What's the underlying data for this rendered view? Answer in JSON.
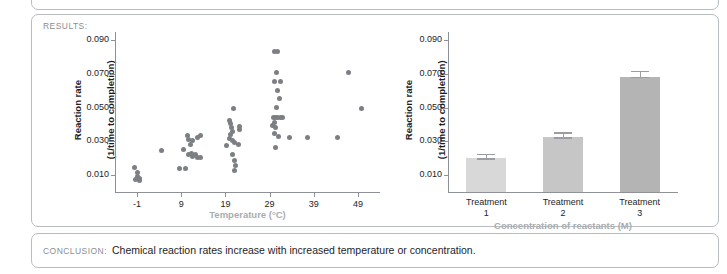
{
  "document": {
    "results_label": "RESULTS:",
    "conclusion_label": "CONCLUSION:",
    "conclusion_text": "Chemical reaction rates increase with increased temperature or concentration."
  },
  "colors": {
    "panel_border": "#b9bcc0",
    "section_label": "#8b8e92",
    "body_text": "#1d1d1f",
    "axis": "#8e9195",
    "dot": "#7c7f83",
    "axis_title_x_muted": "#a9acb0",
    "bar_1": "#d8d8d8",
    "bar_2": "#c6c6c6",
    "bar_3": "#b4b4b4",
    "error_bar": "#9a9da1"
  },
  "chart_data": [
    {
      "id": "scatter-temperature",
      "type": "scatter",
      "title": "",
      "xlabel": "Temperature (°C)",
      "ylabel": "Reaction rate\n(1/time to completion)",
      "ylabel_line1": "Reaction rate",
      "ylabel_line2": "(1/time to completion)",
      "xlabel_color": "#a9acb0",
      "xlim": [
        -6,
        54
      ],
      "ylim": [
        0.0,
        0.095
      ],
      "xticks": [
        -1,
        9,
        19,
        29,
        39,
        49
      ],
      "xtick_labels": [
        "-1",
        "9",
        "19",
        "29",
        "39",
        "49"
      ],
      "yticks": [
        0.01,
        0.03,
        0.05,
        0.07,
        0.09
      ],
      "ytick_labels": [
        "0.010",
        "0.030",
        "0.050",
        "0.070",
        "0.090"
      ],
      "grid": false,
      "legend": "none",
      "points": [
        [
          -1.6,
          0.0145
        ],
        [
          -1.0,
          0.0115
        ],
        [
          -1.0,
          0.0095
        ],
        [
          -0.4,
          0.0082
        ],
        [
          -1.3,
          0.0072
        ],
        [
          -0.5,
          0.0068
        ],
        [
          4.6,
          0.0245
        ],
        [
          8.6,
          0.014
        ],
        [
          9.6,
          0.025
        ],
        [
          10.4,
          0.0335
        ],
        [
          10.6,
          0.031
        ],
        [
          11.0,
          0.0285
        ],
        [
          11.6,
          0.0305
        ],
        [
          12.6,
          0.0325
        ],
        [
          13.4,
          0.0335
        ],
        [
          10.0,
          0.014
        ],
        [
          10.6,
          0.022
        ],
        [
          11.3,
          0.023
        ],
        [
          12.2,
          0.0225
        ],
        [
          12.6,
          0.0205
        ],
        [
          13.4,
          0.0205
        ],
        [
          11.5,
          0.0212
        ],
        [
          20.8,
          0.0495
        ],
        [
          19.9,
          0.0425
        ],
        [
          20.1,
          0.0405
        ],
        [
          20.3,
          0.0385
        ],
        [
          20.5,
          0.036
        ],
        [
          20.2,
          0.034
        ],
        [
          19.9,
          0.032
        ],
        [
          20.6,
          0.0305
        ],
        [
          21.0,
          0.0295
        ],
        [
          19.3,
          0.0275
        ],
        [
          22.1,
          0.039
        ],
        [
          22.3,
          0.037
        ],
        [
          22.0,
          0.0285
        ],
        [
          20.6,
          0.0225
        ],
        [
          21.0,
          0.0185
        ],
        [
          21.3,
          0.016
        ],
        [
          21.1,
          0.0125
        ],
        [
          30.2,
          0.0835
        ],
        [
          30.9,
          0.0835
        ],
        [
          30.5,
          0.071
        ],
        [
          30.0,
          0.0655
        ],
        [
          31.4,
          0.0655
        ],
        [
          30.8,
          0.06
        ],
        [
          31.3,
          0.0555
        ],
        [
          30.6,
          0.05
        ],
        [
          29.6,
          0.0395
        ],
        [
          29.9,
          0.0445
        ],
        [
          30.4,
          0.0445
        ],
        [
          30.9,
          0.0445
        ],
        [
          31.4,
          0.0445
        ],
        [
          31.9,
          0.0445
        ],
        [
          30.2,
          0.0415
        ],
        [
          30.3,
          0.0385
        ],
        [
          30.1,
          0.035
        ],
        [
          31.0,
          0.033
        ],
        [
          30.4,
          0.0265
        ],
        [
          33.4,
          0.0325
        ],
        [
          37.5,
          0.0325
        ],
        [
          44.4,
          0.0325
        ],
        [
          46.8,
          0.071
        ],
        [
          49.9,
          0.0495
        ]
      ]
    },
    {
      "id": "bar-concentration",
      "type": "bar",
      "title": "",
      "xlabel": "Concentration of reactants (M)",
      "ylabel": "Reaction rate\n(1/time to completion)",
      "ylabel_line1": "Reaction rate",
      "ylabel_line2": "(1/time to completion)",
      "xlabel_color": "#a9acb0",
      "categories": [
        "Treatment\n1",
        "Treatment\n2",
        "Treatment\n3"
      ],
      "category_lines": [
        [
          "Treatment",
          "1"
        ],
        [
          "Treatment",
          "2"
        ],
        [
          "Treatment",
          "3"
        ]
      ],
      "values": [
        0.02,
        0.0325,
        0.0685
      ],
      "errors": [
        0.0026,
        0.003,
        0.0035
      ],
      "bar_colors": [
        "#d8d8d8",
        "#c6c6c6",
        "#b4b4b4"
      ],
      "ylim": [
        0.0,
        0.095
      ],
      "yticks": [
        0.01,
        0.03,
        0.05,
        0.07,
        0.09
      ],
      "ytick_labels": [
        "0.010",
        "0.030",
        "0.050",
        "0.070",
        "0.090"
      ],
      "grid": false,
      "legend": "none"
    }
  ]
}
